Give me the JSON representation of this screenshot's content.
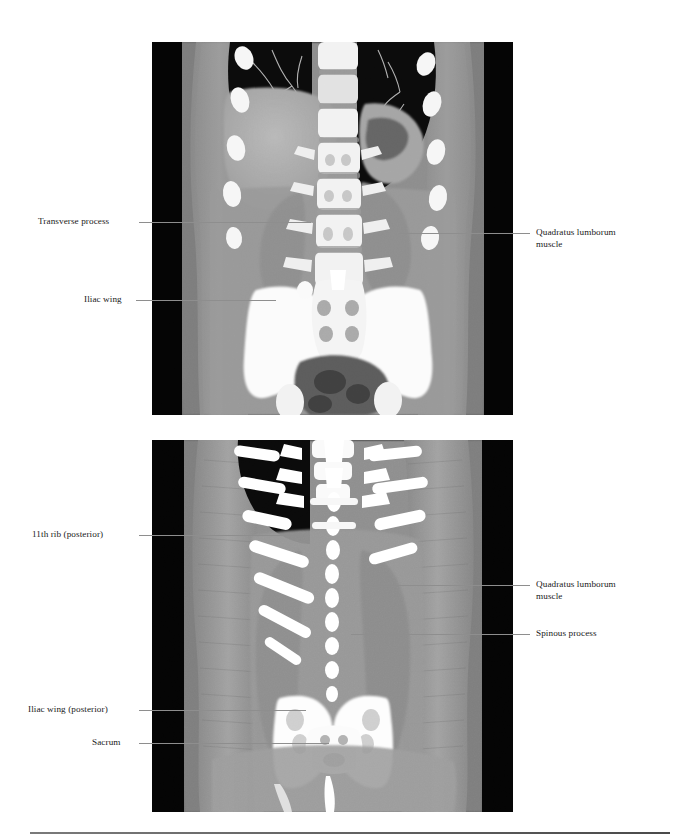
{
  "figure": {
    "type": "ct-coronal-abdomen-plate",
    "panels": [
      {
        "id": "panel-top",
        "caption_text": "",
        "view": "coronal CT of abdomen, mid/anterior plane",
        "x": 152,
        "y": 42,
        "width": 361,
        "height": 373,
        "labels": [
          {
            "name": "transverse-process",
            "text": "Transverse process",
            "side": "left",
            "text_x": 38,
            "text_y": 216,
            "leader_x": 139,
            "leader_y": 222,
            "leader_width": 172
          },
          {
            "name": "iliac-wing",
            "text": "Iliac wing",
            "side": "left",
            "text_x": 84,
            "text_y": 294,
            "leader_x": 136,
            "leader_y": 300,
            "leader_width": 140
          },
          {
            "name": "quadratus-lumborum-muscle",
            "text": "Quadratus lumborum",
            "text_line2": "muscle",
            "side": "right",
            "text_x": 536,
            "text_y": 227,
            "leader_x": 399,
            "leader_y": 233,
            "leader_width": 131
          }
        ]
      },
      {
        "id": "panel-bottom",
        "caption_text": "",
        "view": "coronal CT of abdomen, posterior plane",
        "x": 152,
        "y": 440,
        "width": 361,
        "height": 372,
        "labels": [
          {
            "name": "eleventh-rib-posterior",
            "text": "11th rib (posterior)",
            "side": "left",
            "text_x": 32,
            "text_y": 529,
            "leader_x": 139,
            "leader_y": 535,
            "leader_width": 161
          },
          {
            "name": "iliac-wing-posterior",
            "text": "Iliac wing (posterior)",
            "side": "left",
            "text_x": 28,
            "text_y": 704,
            "leader_x": 139,
            "leader_y": 710,
            "leader_width": 167
          },
          {
            "name": "sacrum",
            "text": "Sacrum",
            "side": "left",
            "text_x": 92,
            "text_y": 737,
            "leader_x": 139,
            "leader_y": 743,
            "leader_width": 190
          },
          {
            "name": "quadratus-lumborum-muscle",
            "text": "Quadratus lumborum",
            "text_line2": "muscle",
            "side": "right",
            "text_x": 536,
            "text_y": 579,
            "leader_x": 371,
            "leader_y": 585,
            "leader_width": 159
          },
          {
            "name": "spinous-process",
            "text": "Spinous process",
            "side": "right",
            "text_x": 536,
            "text_y": 628,
            "leader_x": 351,
            "leader_y": 634,
            "leader_width": 179
          }
        ]
      }
    ],
    "colors": {
      "leader": "#8e8e8e",
      "text": "#1a1a1a",
      "background": "#ffffff",
      "image_border": "#000000",
      "rule": "#5a5a5a"
    }
  }
}
